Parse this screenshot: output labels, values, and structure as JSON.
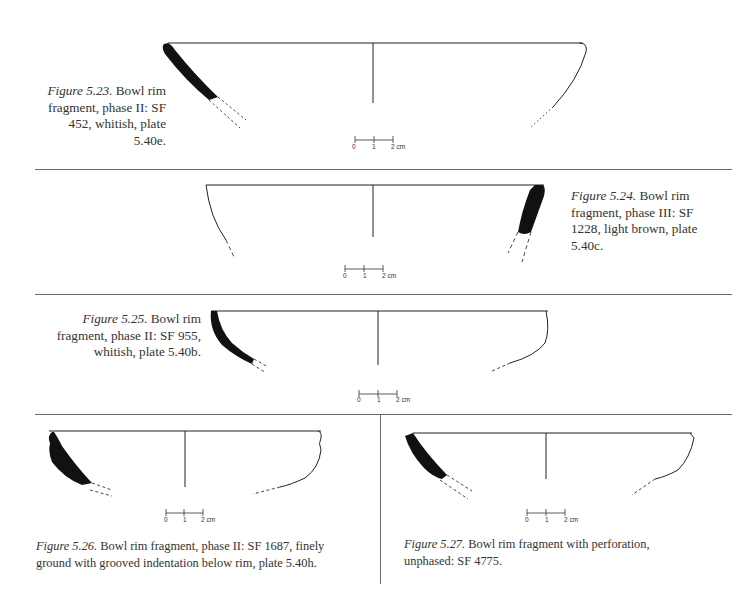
{
  "page": {
    "background": "#ffffff",
    "ink_color": "#111111",
    "rule_color": "#6a6a6a"
  },
  "figures": [
    {
      "id": "5.23",
      "label": "Figure 5.23.",
      "text": "Bowl rim fragment, phase II: SF 452, whitish, plate 5.40e.",
      "lines": [
        "Bowl rim",
        "fragment, phase II: SF",
        "452, whitish, plate",
        "5.40e."
      ],
      "sf": "452",
      "phase": "II",
      "color": "whitish",
      "plate": "5.40e",
      "section_side": "left",
      "caption_position": "left"
    },
    {
      "id": "5.24",
      "label": "Figure 5.24.",
      "text": "Bowl rim fragment, phase III: SF 1228, light brown, plate 5.40c.",
      "lines": [
        "Bowl rim",
        "fragment, phase III: SF",
        "1228, light brown, plate",
        "5.40c."
      ],
      "sf": "1228",
      "phase": "III",
      "color": "light brown",
      "plate": "5.40c",
      "section_side": "right",
      "caption_position": "right"
    },
    {
      "id": "5.25",
      "label": "Figure 5.25.",
      "text": "Bowl rim fragment, phase II: SF 955, whitish, plate 5.40b.",
      "lines": [
        "Bowl rim",
        "fragment, phase II: SF 955,",
        "whitish, plate 5.40b."
      ],
      "sf": "955",
      "phase": "II",
      "color": "whitish",
      "plate": "5.40b",
      "section_side": "left",
      "caption_position": "left"
    },
    {
      "id": "5.26",
      "label": "Figure 5.26.",
      "text": "Bowl rim fragment, phase II: SF 1687, finely ground with grooved indentation below rim, plate 5.40h.",
      "lines": [
        "Bowl rim fragment, phase II: SF 1687, finely",
        "ground with grooved indentation below rim, plate 5.40h."
      ],
      "sf": "1687",
      "phase": "II",
      "plate": "5.40h",
      "section_side": "left",
      "caption_position": "below"
    },
    {
      "id": "5.27",
      "label": "Figure 5.27.",
      "text": "Bowl rim fragment with perforation, unphased: SF 4775.",
      "lines": [
        "Bowl rim fragment with perforation,",
        "unphased: SF 4775."
      ],
      "sf": "4775",
      "phase": "unphased",
      "section_side": "left",
      "caption_position": "below"
    }
  ],
  "scale_bar": {
    "ticks": [
      "0",
      "1",
      "2 cm"
    ],
    "unit": "cm"
  }
}
